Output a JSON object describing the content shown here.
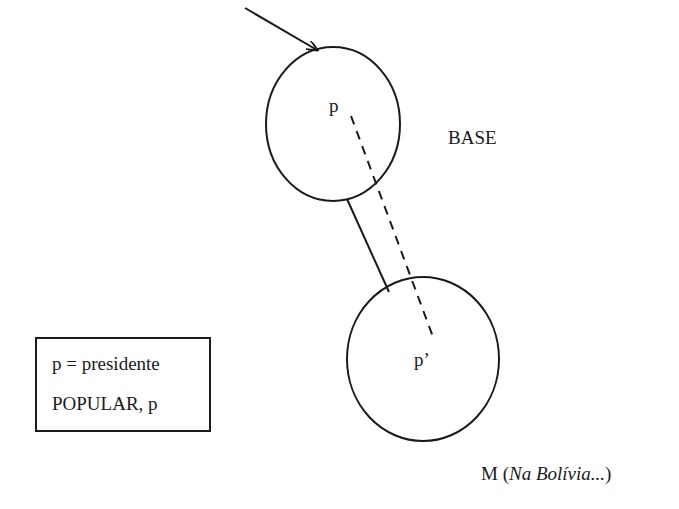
{
  "diagram": {
    "nodes": [
      {
        "id": "upper",
        "label": "p",
        "group_label": "BASE"
      },
      {
        "id": "lower",
        "label": "p’"
      }
    ],
    "edges": [
      {
        "from": "upper",
        "to": "lower",
        "style": "solid",
        "kind": "connector"
      },
      {
        "from": "upper",
        "to": "lower",
        "style": "dashed",
        "kind": "p-to-p-prime"
      }
    ],
    "arrow": {
      "target": "upper",
      "direction": "incoming"
    },
    "labels": {
      "base": "BASE",
      "upper_node": "p",
      "lower_node": "p’",
      "caption_main": "M (",
      "caption_italic": "Na Bolívia...",
      "caption_close": ")"
    },
    "legend": {
      "line1": "p = presidente",
      "line2": "POPULAR, p"
    },
    "colors": {
      "stroke": "#1a1a1a",
      "background": "#ffffff"
    }
  }
}
